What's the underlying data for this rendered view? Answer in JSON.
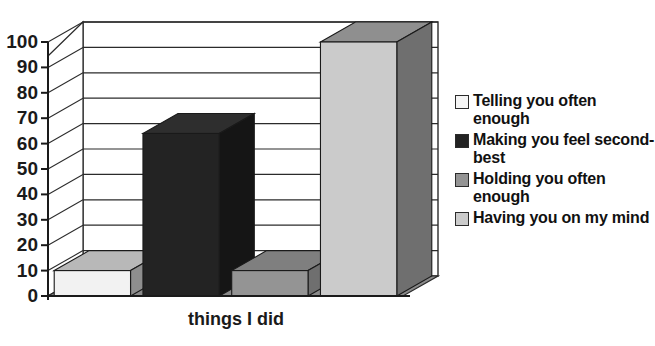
{
  "chart_data": {
    "type": "bar",
    "title": "",
    "xlabel": "things I did",
    "ylabel": "",
    "categories": [
      "Telling you often enough",
      "Making you feel second-best",
      "Holding you often enough",
      "Having you on my mind"
    ],
    "values": [
      10,
      64,
      10,
      100
    ],
    "ylim": [
      0,
      100
    ],
    "yticks": [
      0,
      10,
      20,
      30,
      40,
      50,
      60,
      70,
      80,
      90,
      100
    ],
    "ytick_labels": [
      "0",
      "10",
      "20",
      "30",
      "40",
      "50",
      "60",
      "70",
      "80",
      "90",
      "100"
    ],
    "grid": true,
    "legend_position": "right",
    "style": "3d-column",
    "series": [
      {
        "name": "things I did",
        "values": [
          10,
          64,
          10,
          100
        ]
      }
    ],
    "bar_colors": [
      "#f2f2f2",
      "#232323",
      "#949494",
      "#cbcbcb"
    ],
    "bar_top_colors": [
      "#b8b8b8",
      "#2e2e2e",
      "#7f7f7f",
      "#8f8f8f"
    ],
    "bar_side_colors": [
      "#8e8e8e",
      "#151515",
      "#6f6f6f",
      "#6f6f6f"
    ],
    "floor_color": "#8a8a8a",
    "wall_color": "#ffffff",
    "gridline_color": "#2b2b2b",
    "axis_color": "#1a1a1a"
  },
  "legend": {
    "items": [
      {
        "label": "Telling you often enough",
        "swatch": "#f5f5f5"
      },
      {
        "label": "Making you feel second-best",
        "swatch": "#232323"
      },
      {
        "label": "Holding you often enough",
        "swatch": "#949494"
      },
      {
        "label": "Having you on my mind",
        "swatch": "#cbcbcb"
      }
    ]
  }
}
